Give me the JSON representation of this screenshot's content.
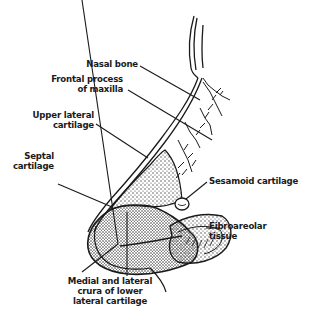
{
  "diagram": {
    "colors": {
      "ink": "#1a1a1a",
      "stipple": "#3a3a3a",
      "background": "#ffffff"
    },
    "labels": [
      {
        "id": "nasal-bone",
        "lines": [
          "Nasal bone"
        ]
      },
      {
        "id": "frontal-process",
        "lines": [
          "Frontal process",
          "of maxilla"
        ]
      },
      {
        "id": "upper-lateral",
        "lines": [
          "Upper lateral",
          "cartilage"
        ]
      },
      {
        "id": "septal",
        "lines": [
          "Septal",
          "cartilage"
        ]
      },
      {
        "id": "sesamoid",
        "lines": [
          "Sesamoid cartilage"
        ]
      },
      {
        "id": "fibroareolar",
        "lines": [
          "Fibroareolar",
          "tissue"
        ]
      },
      {
        "id": "crura",
        "lines": [
          "Medial and lateral",
          "crura of lower",
          "lateral cartilage"
        ]
      }
    ]
  }
}
